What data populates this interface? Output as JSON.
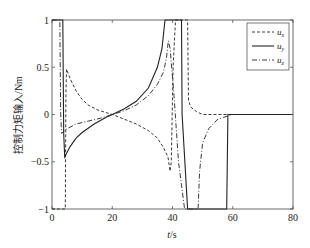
{
  "chart_data": {
    "type": "line",
    "title": "",
    "xlabel": "t/s",
    "ylabel": "控制力矩输入/Nm",
    "xlim": [
      0,
      80
    ],
    "ylim": [
      -1,
      1
    ],
    "xticks": [
      0,
      20,
      40,
      60,
      80
    ],
    "yticks": [
      -1,
      -0.5,
      0,
      0.5,
      1
    ],
    "xtick_labels": [
      "0",
      "20",
      "40",
      "60",
      "80"
    ],
    "ytick_labels": [
      "-1",
      "-0.5",
      "0",
      "0.5",
      "1"
    ],
    "grid": false,
    "legend_position": "upper right",
    "series": [
      {
        "name": "u_x",
        "style": "dashed",
        "x": [
          0,
          4.4,
          4.6,
          4.8,
          6,
          8,
          10,
          12,
          15,
          18,
          20,
          24,
          28,
          32,
          35,
          37,
          38.5,
          39.2,
          39.6,
          40.2,
          41,
          45,
          45.3,
          46,
          48,
          50,
          55,
          80
        ],
        "y": [
          -1,
          -1,
          0.2,
          0.48,
          0.38,
          0.25,
          0.16,
          0.1,
          0.05,
          0.02,
          0.0,
          -0.05,
          -0.1,
          -0.17,
          -0.25,
          -0.35,
          -0.45,
          -0.6,
          -0.5,
          0.5,
          1.0,
          1.0,
          0.15,
          0.08,
          0.03,
          0.0,
          0.0,
          0.0
        ]
      },
      {
        "name": "u_y",
        "style": "solid",
        "x": [
          0,
          3.6,
          3.9,
          4.2,
          6,
          8,
          10,
          14,
          18,
          20,
          24,
          28,
          32,
          35,
          36.5,
          37.5,
          43,
          43.2,
          45,
          58,
          58.4,
          80
        ],
        "y": [
          1.0,
          1.0,
          -0.2,
          -0.45,
          -0.34,
          -0.25,
          -0.19,
          -0.1,
          -0.03,
          0.0,
          0.06,
          0.14,
          0.28,
          0.5,
          0.7,
          1.0,
          1.0,
          0.0,
          -1.0,
          -1.0,
          0.0,
          0.0
        ]
      },
      {
        "name": "u_z",
        "style": "dashdot",
        "x": [
          0,
          2.6,
          2.9,
          3.2,
          5,
          8,
          12,
          16,
          20,
          24,
          28,
          32,
          35,
          37,
          38,
          38.6,
          39.2,
          40.5,
          42,
          44,
          48.5,
          49,
          50,
          52,
          55,
          60,
          80
        ],
        "y": [
          1.0,
          1.0,
          0.0,
          -0.2,
          -0.15,
          -0.1,
          -0.07,
          -0.04,
          0.0,
          0.04,
          0.1,
          0.2,
          0.32,
          0.45,
          0.6,
          0.78,
          0.7,
          0.2,
          -0.5,
          -1.0,
          -1.0,
          -0.6,
          -0.3,
          -0.15,
          -0.05,
          0.0,
          0.0
        ]
      }
    ]
  },
  "legend": {
    "items": [
      {
        "label": "u_x",
        "base": "u",
        "sub": "x",
        "style": "dashed"
      },
      {
        "label": "u_y",
        "base": "u",
        "sub": "y",
        "style": "solid"
      },
      {
        "label": "u_z",
        "base": "u",
        "sub": "z",
        "style": "dashdot"
      }
    ]
  }
}
